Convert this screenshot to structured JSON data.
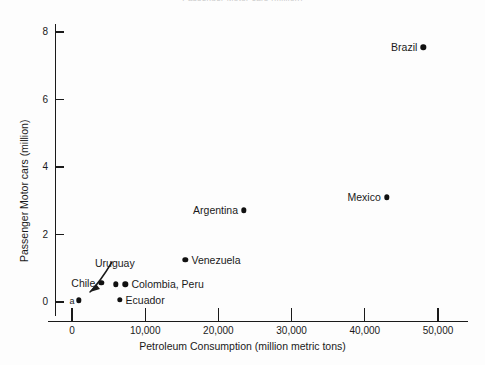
{
  "figure": {
    "clipped_header": "Passenger Motor cars (million)",
    "background_color": "#fdfdfd",
    "ink_color": "#1a1a1a",
    "marker_color": "#111111"
  },
  "chart_data": {
    "type": "scatter",
    "title": "",
    "xlabel": "Petroleum Consumption (million metric tons)",
    "ylabel": "Passenger Motor cars (million)",
    "xlim": [
      -2000,
      52000
    ],
    "ylim": [
      -0.45,
      8.6
    ],
    "xticks": [
      0,
      10000,
      20000,
      30000,
      40000,
      50000
    ],
    "xticklabels": [
      "0",
      "10,000",
      "20,000",
      "30,000",
      "40,000",
      "50,000"
    ],
    "yticks": [
      0,
      2,
      4,
      6,
      8
    ],
    "yticklabels": [
      "0",
      "2",
      "4",
      "6",
      "8"
    ],
    "grid": false,
    "legend": false,
    "points": [
      {
        "label": "Brazil",
        "x": 48000,
        "y": 7.55,
        "label_side": "left"
      },
      {
        "label": "Mexico",
        "x": 43000,
        "y": 3.1,
        "label_side": "left"
      },
      {
        "label": "Argentina",
        "x": 23500,
        "y": 2.72,
        "label_side": "left"
      },
      {
        "label": "Venezuela",
        "x": 15500,
        "y": 1.25,
        "label_side": "right"
      },
      {
        "label": "Colombia, Peru",
        "x": 7300,
        "y": 0.52,
        "label_side": "right"
      },
      {
        "label": "",
        "x": 6000,
        "y": 0.52,
        "label_side": "none"
      },
      {
        "label": "Chile",
        "x": 4000,
        "y": 0.56,
        "label_side": "left"
      },
      {
        "label": "Ecuador",
        "x": 6500,
        "y": 0.07,
        "label_side": "right"
      },
      {
        "label": "Uruguay",
        "x": 900,
        "y": 0.05,
        "label_side": "none"
      }
    ],
    "annotations": [
      {
        "text": "Uruguay",
        "kind": "arrow-callout",
        "points_to": {
          "x": 900,
          "y": 0.05
        }
      },
      {
        "text": "a",
        "kind": "footnote-marker",
        "attached_to": "Uruguay"
      }
    ]
  }
}
